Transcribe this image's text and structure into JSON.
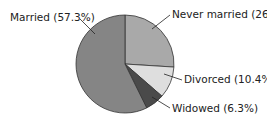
{
  "chart_data": {
    "type": "pie",
    "title": "",
    "slices": [
      {
        "label": "Never married",
        "value": 26,
        "display": "Never married (26%)",
        "color": "#a9a9a9"
      },
      {
        "label": "Divorced",
        "value": 10.4,
        "display": "Divorced (10.4%)",
        "color": "#dedede"
      },
      {
        "label": "Widowed",
        "value": 6.3,
        "display": "Widowed (6.3%)",
        "color": "#4a4a4a"
      },
      {
        "label": "Married",
        "value": 57.3,
        "display": "Married (57.3%)",
        "color": "#858585"
      }
    ],
    "start_angle_deg": 0,
    "direction": "clockwise",
    "legend": "none (direct labels)"
  }
}
